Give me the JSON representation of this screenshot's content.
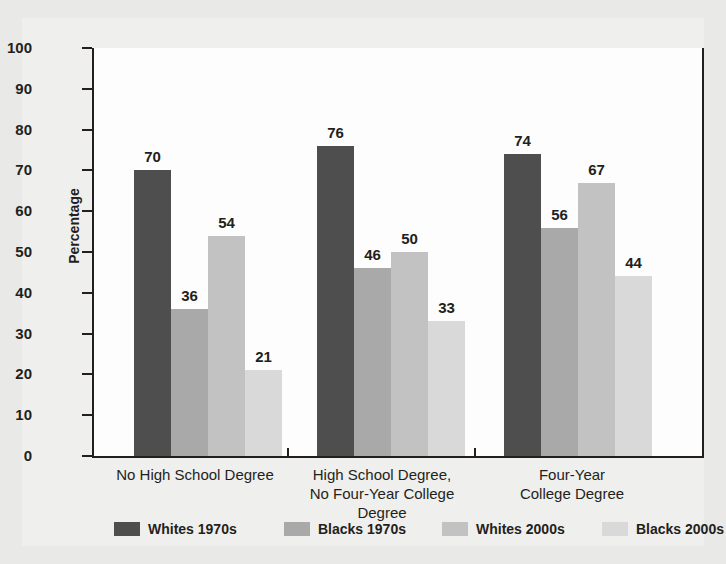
{
  "chart_data": {
    "type": "bar",
    "title": "",
    "subtitle": "",
    "xlabel": "",
    "ylabel": "Percentage",
    "ylim": [
      0,
      100
    ],
    "ytick_step": 10,
    "yticks": [
      0,
      10,
      20,
      30,
      40,
      50,
      60,
      70,
      80,
      90,
      100
    ],
    "grid": false,
    "legend_position": "bottom",
    "data_labels": true,
    "categories": [
      "No High School Degree",
      "High School Degree,\nNo Four-Year College Degree",
      "Four-Year\nCollege Degree"
    ],
    "series": [
      {
        "name": "Whites 1970s",
        "color": "#4e4e4e",
        "values": [
          70,
          76,
          74
        ]
      },
      {
        "name": "Blacks 1970s",
        "color": "#a9a9a9",
        "values": [
          36,
          46,
          56
        ]
      },
      {
        "name": "Whites 2000s",
        "color": "#c2c2c2",
        "values": [
          54,
          50,
          67
        ]
      },
      {
        "name": "Blacks 2000s",
        "color": "#d9d9d9",
        "values": [
          21,
          33,
          44
        ]
      }
    ]
  },
  "colors": {
    "page_background": "#e9e9e7",
    "card_background": "#efefed",
    "plot_background": "#fdfdfd",
    "axis": "#231f20",
    "text": "#231f20"
  }
}
